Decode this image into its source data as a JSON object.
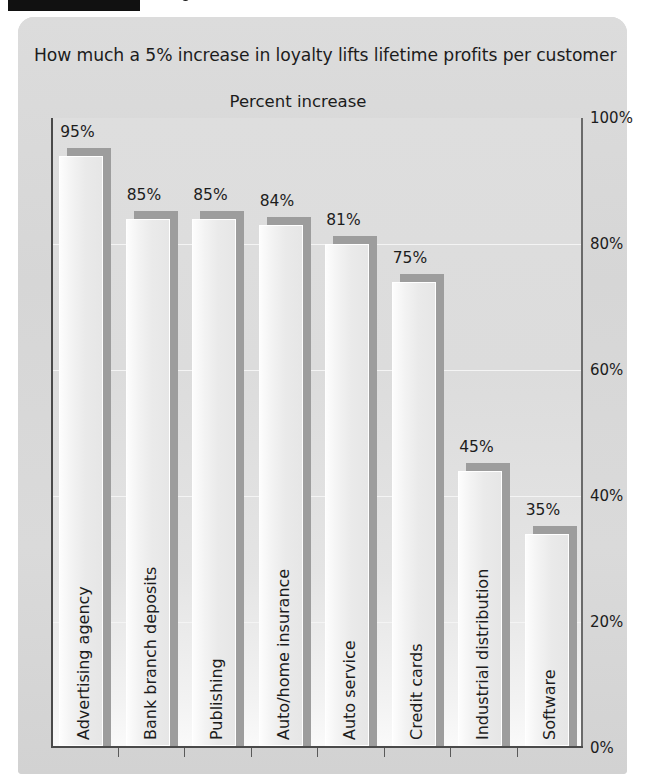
{
  "figure": {
    "caption_bar": "figure-caption-redacted"
  },
  "chart_data": {
    "type": "bar",
    "title": "How much a 5% increase in loyalty lifts lifetime profits per customer",
    "subtitle": "Percent increase",
    "xlabel": "",
    "ylabel": "Percent increase",
    "ylim": [
      0,
      100
    ],
    "yticks": [
      "0%",
      "20%",
      "40%",
      "60%",
      "80%",
      "100%"
    ],
    "ytick_values": [
      0,
      20,
      40,
      60,
      80,
      100
    ],
    "y_axis_position": "right",
    "grid": true,
    "legend": "none",
    "categories": [
      "Advertising agency",
      "Bank branch deposits",
      "Publishing",
      "Auto/home insurance",
      "Auto service",
      "Credit cards",
      "Industrial distribution",
      "Software"
    ],
    "values": [
      95,
      85,
      85,
      84,
      81,
      75,
      45,
      35
    ],
    "value_labels": [
      "95%",
      "85%",
      "85%",
      "84%",
      "81%",
      "75%",
      "45%",
      "35%"
    ]
  },
  "colors": {
    "panel_background": "#d8d8d8",
    "plot_background": "#dedede",
    "bar_fill": "#f0f0f0",
    "bar_shadow": "#9d9d9d",
    "axis": "#4a4a4a",
    "gridline": "#f4f4f4",
    "text": "#1c1c1c"
  }
}
